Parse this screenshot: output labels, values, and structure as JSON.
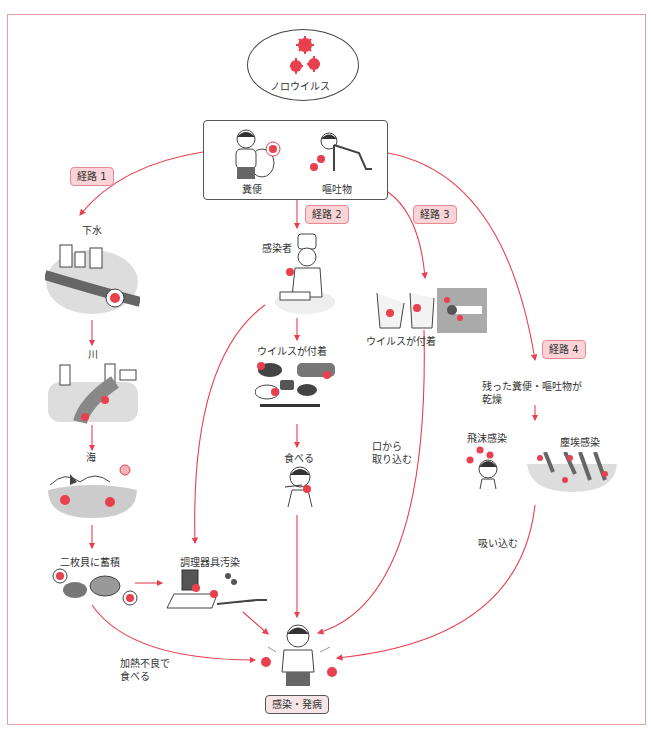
{
  "diagram": {
    "type": "flowchart",
    "accent_color": "#e8404e",
    "label_bg": "#f9d3d6",
    "frame_color": "#e8a0a8",
    "source": {
      "label": "ノロウイルス",
      "icon": "virus-icon"
    },
    "origin": {
      "items": [
        {
          "label": "糞便",
          "icon": "person-on-toilet-icon"
        },
        {
          "label": "嘔吐物",
          "icon": "person-vomiting-icon"
        }
      ]
    },
    "routes": [
      {
        "label": "経路 1",
        "steps": [
          {
            "label": "下水",
            "icon": "sewage-city-icon"
          },
          {
            "label": "川",
            "icon": "river-icon"
          },
          {
            "label": "海",
            "icon": "sea-icon"
          },
          {
            "label": "二枚貝に蓄積",
            "icon": "shellfish-icon"
          }
        ],
        "edge_label": "加熱不良で\n食べる"
      },
      {
        "label": "経路 2",
        "steps": [
          {
            "label": "感染者",
            "icon": "infected-cook-icon"
          },
          {
            "label": "ウイルスが付着",
            "icon": "contaminated-food-icon"
          },
          {
            "label": "食べる",
            "icon": "person-eating-icon"
          }
        ],
        "side_step": {
          "label": "調理器具汚染",
          "icon": "cooking-utensils-icon"
        }
      },
      {
        "label": "経路 3",
        "steps": [
          {
            "label": "ウイルスが付着",
            "icon": "hands-doorknob-icon"
          }
        ],
        "edge_label": "口から\n取り込む"
      },
      {
        "label": "経路 4",
        "steps": [
          {
            "label": "残った糞便・嘔吐物が\n乾燥"
          },
          {
            "label": "飛沫感染",
            "icon": "droplet-infection-icon"
          },
          {
            "label": "塵埃感染",
            "icon": "dust-infection-icon"
          }
        ],
        "edge_label": "吸い込む"
      }
    ],
    "outcome": {
      "label": "感染・発病",
      "icon": "sick-person-icon"
    }
  }
}
